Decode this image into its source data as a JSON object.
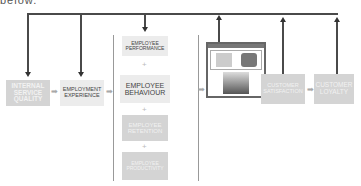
{
  "caption": "below.",
  "boxes": {
    "internal_service_quality": "INTERNAL SERVICE QUALITY",
    "employment_experience": "EMPLOYMENT EXPERIENCE",
    "employee_performance": "EMPLOYEE PERFORMANCE",
    "employee_behaviour": "EMPLOYEE BEHAVIOUR",
    "employee_retention": "EMPLOYEE RETENTION",
    "employee_productivity": "EMPLOYEE PRODUCTIVITY",
    "customer_satisfaction": "CUSTOMER SATISFACTION",
    "customer_loyalty": "CUSTOMER LOYALTY"
  },
  "symbols": {
    "plus": "+",
    "arrow": "➡"
  },
  "colors": {
    "line": "#4a4a4a",
    "box_gray": "#d4d4d4",
    "box_light": "#ececec",
    "frame": "#666666"
  }
}
